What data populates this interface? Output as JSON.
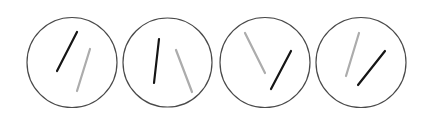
{
  "canvas": {
    "width": 429,
    "height": 116,
    "background": "#ffffff"
  },
  "colors": {
    "circle_stroke": "#4a4a4a",
    "line_dark": "#151515",
    "line_light": "#acacac"
  },
  "panels": [
    {
      "circle": {
        "cx": 72,
        "cy": 62.5,
        "r": 45
      },
      "lines": [
        {
          "tone": "dark",
          "x1": 57,
          "y1": 71,
          "x2": 77,
          "y2": 32
        },
        {
          "tone": "light",
          "x1": 77,
          "y1": 91,
          "x2": 90,
          "y2": 49
        }
      ]
    },
    {
      "circle": {
        "cx": 167.5,
        "cy": 62.5,
        "r": 44.5
      },
      "lines": [
        {
          "tone": "dark",
          "x1": 154,
          "y1": 83,
          "x2": 159,
          "y2": 39
        },
        {
          "tone": "light",
          "x1": 176,
          "y1": 50,
          "x2": 192,
          "y2": 92
        }
      ]
    },
    {
      "circle": {
        "cx": 265,
        "cy": 62.5,
        "r": 45
      },
      "lines": [
        {
          "tone": "light",
          "x1": 245,
          "y1": 33,
          "x2": 265,
          "y2": 73
        },
        {
          "tone": "dark",
          "x1": 271,
          "y1": 89,
          "x2": 291,
          "y2": 51
        }
      ]
    },
    {
      "circle": {
        "cx": 361,
        "cy": 62.5,
        "r": 45
      },
      "lines": [
        {
          "tone": "light",
          "x1": 346,
          "y1": 76,
          "x2": 359,
          "y2": 33
        },
        {
          "tone": "dark",
          "x1": 358,
          "y1": 85,
          "x2": 385,
          "y2": 51
        }
      ]
    }
  ]
}
